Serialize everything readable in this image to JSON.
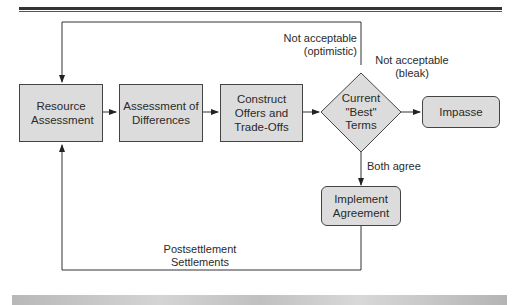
{
  "diagram": {
    "nodes": {
      "resource_assessment": "Resource Assessment",
      "assessment_of_differences": "Assessment of Differences",
      "construct_offers": "Construct Offers and Trade-Offs",
      "current_best_terms": "Current \"Best\" Terms",
      "impasse": "Impasse",
      "implement_agreement": "Implement Agreement"
    },
    "edge_labels": {
      "not_acceptable_optimistic_1": "Not acceptable",
      "not_acceptable_optimistic_2": "(optimistic)",
      "not_acceptable_bleak_1": "Not acceptable",
      "not_acceptable_bleak_2": "(bleak)",
      "both_agree": "Both agree",
      "postsettlement_1": "Postsettlement",
      "postsettlement_2": "Settlements"
    },
    "colors": {
      "box_fill": "#dcdcdc",
      "stroke": "#333333"
    }
  }
}
